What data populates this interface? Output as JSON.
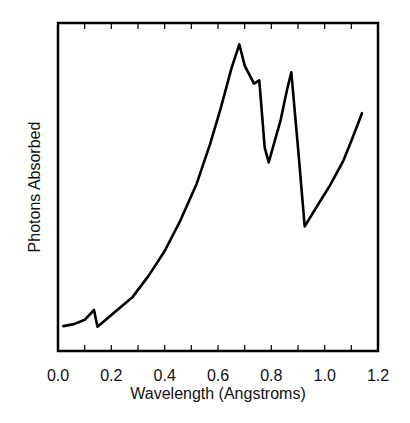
{
  "chart_data": {
    "type": "line",
    "title": "",
    "xlabel": "Wavelength (Angstroms)",
    "ylabel": "Photons Absorbed",
    "xlim": [
      0.0,
      1.2
    ],
    "ylim": [
      0,
      100
    ],
    "y_units": "arbitrary (normalized, no tick labels shown)",
    "x_ticks": [
      0.0,
      0.2,
      0.4,
      0.6,
      0.8,
      1.0,
      1.2
    ],
    "x_tick_labels": [
      "0.0",
      "0.2",
      "0.4",
      "0.6",
      "0.8",
      "1.0",
      "1.2"
    ],
    "x_minor_ticks": [
      0.1,
      0.3,
      0.5,
      0.7,
      0.9,
      1.1
    ],
    "grid": false,
    "legend": null,
    "series": [
      {
        "name": "absorption",
        "color": "#000000",
        "points": [
          [
            0.02,
            7.6
          ],
          [
            0.06,
            8.2
          ],
          [
            0.1,
            9.5
          ],
          [
            0.135,
            12.5
          ],
          [
            0.14,
            10.6
          ],
          [
            0.148,
            7.4
          ],
          [
            0.2,
            11.0
          ],
          [
            0.28,
            16.5
          ],
          [
            0.34,
            23.0
          ],
          [
            0.4,
            30.5
          ],
          [
            0.46,
            40.0
          ],
          [
            0.52,
            51.0
          ],
          [
            0.57,
            63.0
          ],
          [
            0.61,
            74.0
          ],
          [
            0.65,
            86.0
          ],
          [
            0.68,
            93.5
          ],
          [
            0.7,
            87.0
          ],
          [
            0.735,
            81.5
          ],
          [
            0.755,
            82.5
          ],
          [
            0.775,
            62.0
          ],
          [
            0.79,
            57.5
          ],
          [
            0.835,
            70.5
          ],
          [
            0.86,
            80.0
          ],
          [
            0.875,
            85.0
          ],
          [
            0.9,
            62.0
          ],
          [
            0.925,
            38.0
          ],
          [
            0.97,
            44.0
          ],
          [
            1.02,
            50.5
          ],
          [
            1.07,
            58.0
          ],
          [
            1.1,
            64.0
          ],
          [
            1.14,
            72.5
          ]
        ],
        "annotations": [
          {
            "x": 0.14,
            "label": "small absorption edge"
          },
          {
            "x": 0.73,
            "label": "edge"
          },
          {
            "x": 0.79,
            "label": "edge"
          },
          {
            "x": 0.91,
            "label": "edge"
          }
        ]
      }
    ]
  }
}
